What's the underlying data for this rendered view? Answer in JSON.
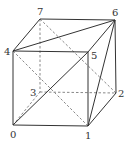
{
  "diagram": {
    "type": "cube-graph",
    "vertices": [
      {
        "id": "0",
        "label": "0",
        "x": 13,
        "y": 125,
        "lx": 10,
        "ly": 138
      },
      {
        "id": "1",
        "label": "1",
        "x": 88,
        "y": 126,
        "lx": 85,
        "ly": 139
      },
      {
        "id": "2",
        "label": "2",
        "x": 116,
        "y": 93,
        "lx": 118,
        "ly": 97
      },
      {
        "id": "3",
        "label": "3",
        "x": 40,
        "y": 92,
        "lx": 30,
        "ly": 96
      },
      {
        "id": "4",
        "label": "4",
        "x": 13,
        "y": 51,
        "lx": 4,
        "ly": 55
      },
      {
        "id": "5",
        "label": "5",
        "x": 88,
        "y": 52,
        "lx": 91,
        "ly": 59
      },
      {
        "id": "6",
        "label": "6",
        "x": 115,
        "y": 20,
        "lx": 112,
        "ly": 16
      },
      {
        "id": "7",
        "label": "7",
        "x": 40,
        "y": 19,
        "lx": 37,
        "ly": 15
      }
    ],
    "solid_edges": [
      [
        "0",
        "1"
      ],
      [
        "0",
        "4"
      ],
      [
        "1",
        "5"
      ],
      [
        "4",
        "5"
      ],
      [
        "4",
        "7"
      ],
      [
        "7",
        "6"
      ],
      [
        "5",
        "6"
      ],
      [
        "6",
        "2"
      ],
      [
        "1",
        "2"
      ],
      [
        "4",
        "6"
      ],
      [
        "0",
        "5"
      ],
      [
        "1",
        "6"
      ]
    ],
    "dashed_edges": [
      [
        "7",
        "3"
      ],
      [
        "3",
        "2"
      ],
      [
        "0",
        "3"
      ],
      [
        "4",
        "1"
      ],
      [
        "7",
        "2"
      ]
    ]
  }
}
